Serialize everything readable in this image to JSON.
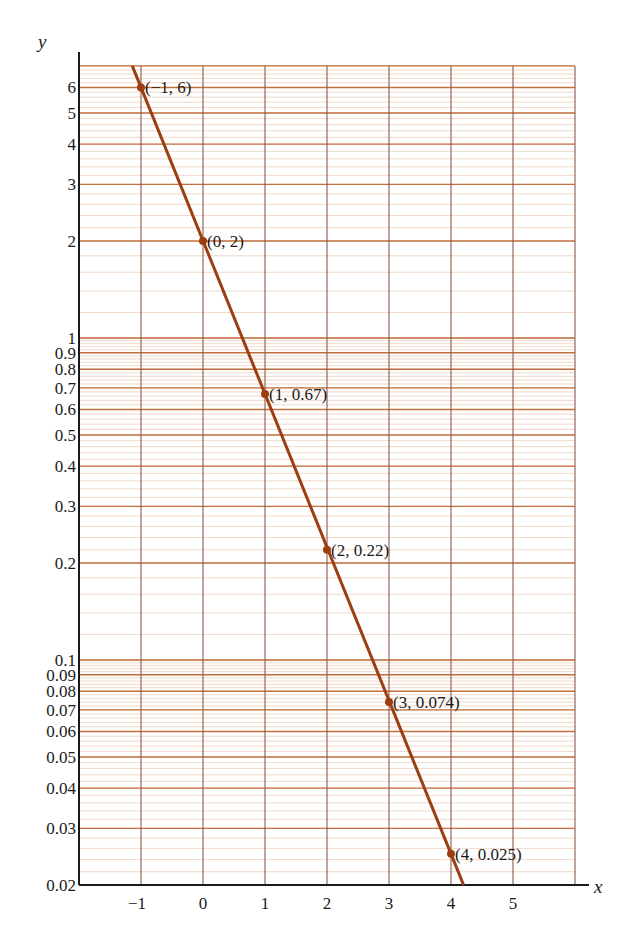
{
  "chart_data": {
    "type": "line",
    "title": "",
    "xlabel": "x",
    "ylabel": "y",
    "yscale": "log",
    "xlim": [
      -2,
      6
    ],
    "ylim": [
      0.02,
      7
    ],
    "grid": true,
    "x_ticks": [
      -1,
      0,
      1,
      2,
      3,
      4,
      5
    ],
    "x_tick_labels": [
      "−1",
      "0",
      "1",
      "2",
      "3",
      "4",
      "5"
    ],
    "y_ticks": [
      0.02,
      0.03,
      0.04,
      0.05,
      0.06,
      0.07,
      0.08,
      0.09,
      0.1,
      0.2,
      0.3,
      0.4,
      0.5,
      0.6,
      0.7,
      0.8,
      0.9,
      1,
      2,
      3,
      4,
      5,
      6
    ],
    "y_tick_labels": [
      "0.02",
      "0.03",
      "0.04",
      "0.05",
      "0.06",
      "0.07",
      "0.08",
      "0.09",
      "0.1",
      "0.2",
      "0.3",
      "0.4",
      "0.5",
      "0.6",
      "0.7",
      "0.8",
      "0.9",
      "1",
      "2",
      "3",
      "4",
      "5",
      "6"
    ],
    "series": [
      {
        "name": "y = 2(1/3)^x",
        "x": [
          -1,
          0,
          1,
          2,
          3,
          4
        ],
        "y": [
          6,
          2,
          0.67,
          0.22,
          0.074,
          0.025
        ],
        "labels": [
          "(−1, 6)",
          "(0, 2)",
          "(1, 0.67)",
          "(2, 0.22)",
          "(3, 0.074)",
          "(4, 0.025)"
        ],
        "color": "#9c3d12"
      }
    ],
    "colors": {
      "line": "#9c3d12",
      "major_grid": "#c2703f",
      "minor_grid": "#e9c7b3",
      "vertical_grid": "#8a5a4a",
      "axis": "#1a1a1a"
    }
  }
}
